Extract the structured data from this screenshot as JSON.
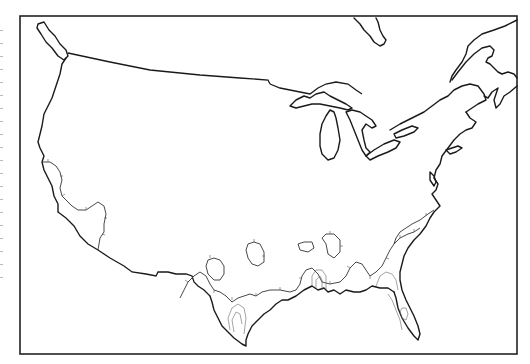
{
  "map": {
    "type": "contour outline map",
    "region": "Contiguous United States with southern Canada",
    "style": "black and white line drawing",
    "frame": {
      "x": 20,
      "y": 16,
      "width": 497,
      "height": 338,
      "stroke": "#222222"
    },
    "colors": {
      "background": "#ffffff",
      "coastline": "#1a1a1a",
      "contour": "#333333"
    },
    "features": [
      {
        "id": "coastline-west",
        "label": "Pacific coastline"
      },
      {
        "id": "coastline-gulf",
        "label": "Gulf of Mexico coastline"
      },
      {
        "id": "coastline-atlantic",
        "label": "Atlantic coastline"
      },
      {
        "id": "great-lakes",
        "label": "Great Lakes"
      },
      {
        "id": "us-canada-border",
        "label": "US-Canada border"
      },
      {
        "id": "us-mexico-border",
        "label": "US-Mexico border"
      },
      {
        "id": "contour-lines",
        "label": "Hatched contour isolines"
      }
    ]
  }
}
